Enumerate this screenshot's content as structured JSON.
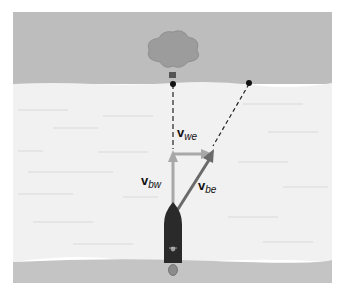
{
  "diagram": {
    "type": "river-crossing vector diagram",
    "colors": {
      "far_bank": "#bdbdbd",
      "water": "#f1f1f1",
      "near_bank": "#c4c4c4",
      "tree_canopy": "#9c9c9c",
      "boat": "#2a2a2a",
      "vector_light": "#a8a8a8",
      "vector_dark": "#6a6a6a",
      "dot": "#111111"
    },
    "vectors": [
      {
        "id": "v_bw",
        "symbol": "v",
        "subscript": "bw",
        "direction": "up"
      },
      {
        "id": "v_we",
        "symbol": "v",
        "subscript": "we",
        "direction": "right"
      },
      {
        "id": "v_be",
        "symbol": "v",
        "subscript": "be",
        "direction": "up-right"
      }
    ],
    "labels": {
      "v_bw": {
        "main": "v",
        "sub": "bw"
      },
      "v_we": {
        "main": "v",
        "sub": "we"
      },
      "v_be": {
        "main": "v",
        "sub": "be"
      }
    },
    "markers": [
      "target-dot-straight-across",
      "landing-dot-downstream"
    ]
  }
}
